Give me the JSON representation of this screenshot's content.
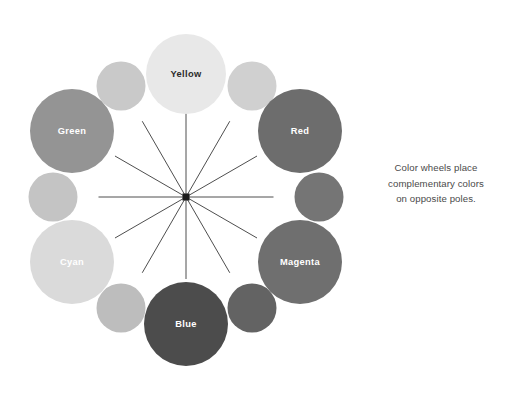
{
  "figure": {
    "title": "",
    "background": "#ffffff",
    "center": {
      "x": 186,
      "y": 197,
      "hub_size": 7,
      "hub_color": "#1c1c1c"
    },
    "spoke_color": "#3a3a3a",
    "spoke_width": 0.9,
    "major_radius": 123,
    "minor_radius": 111,
    "nodes": [
      {
        "label": "Yellow",
        "angle_deg": -90,
        "radius": 40,
        "fill": "#e8e8e8",
        "text_color": "#2b2b2b",
        "ring": "major",
        "cx": 186,
        "cy": 74
      },
      {
        "label": "",
        "angle_deg": -60,
        "radius": 24.5,
        "fill": "#d0d0d0",
        "text_color": "#ffffff",
        "ring": "minor",
        "cx": 252,
        "cy": 86
      },
      {
        "label": "Red",
        "angle_deg": -30,
        "radius": 42,
        "fill": "#6d6d6d",
        "text_color": "#ffffff",
        "ring": "major",
        "cx": 300,
        "cy": 131
      },
      {
        "label": "",
        "angle_deg": 0,
        "radius": 24.5,
        "fill": "#757575",
        "text_color": "#ffffff",
        "ring": "minor",
        "cx": 319,
        "cy": 197
      },
      {
        "label": "Magenta",
        "angle_deg": 30,
        "radius": 42,
        "fill": "#6f6f6f",
        "text_color": "#ffffff",
        "ring": "major",
        "cx": 300,
        "cy": 262
      },
      {
        "label": "",
        "angle_deg": 60,
        "radius": 24.5,
        "fill": "#636363",
        "text_color": "#ffffff",
        "ring": "minor",
        "cx": 252,
        "cy": 308
      },
      {
        "label": "Blue",
        "angle_deg": 90,
        "radius": 42,
        "fill": "#4c4c4c",
        "text_color": "#ffffff",
        "ring": "major",
        "cx": 186,
        "cy": 324
      },
      {
        "label": "",
        "angle_deg": 120,
        "radius": 24.5,
        "fill": "#bdbdbd",
        "text_color": "#ffffff",
        "ring": "minor",
        "cx": 121,
        "cy": 308
      },
      {
        "label": "Cyan",
        "angle_deg": 150,
        "radius": 42,
        "fill": "#dadada",
        "text_color": "#ffffff",
        "ring": "major",
        "cx": 72,
        "cy": 262
      },
      {
        "label": "",
        "angle_deg": 180,
        "radius": 24.5,
        "fill": "#c4c4c4",
        "text_color": "#ffffff",
        "ring": "minor",
        "cx": 53,
        "cy": 197
      },
      {
        "label": "Green",
        "angle_deg": 210,
        "radius": 42,
        "fill": "#949494",
        "text_color": "#ffffff",
        "ring": "major",
        "cx": 72,
        "cy": 131
      },
      {
        "label": "",
        "angle_deg": 240,
        "radius": 24.5,
        "fill": "#c9c9c9",
        "text_color": "#ffffff",
        "ring": "minor",
        "cx": 121,
        "cy": 86
      }
    ]
  },
  "caption": {
    "lines": [
      "Color wheels place",
      "complementary colors",
      "on opposite poles."
    ],
    "color": "#4a4a4a"
  }
}
